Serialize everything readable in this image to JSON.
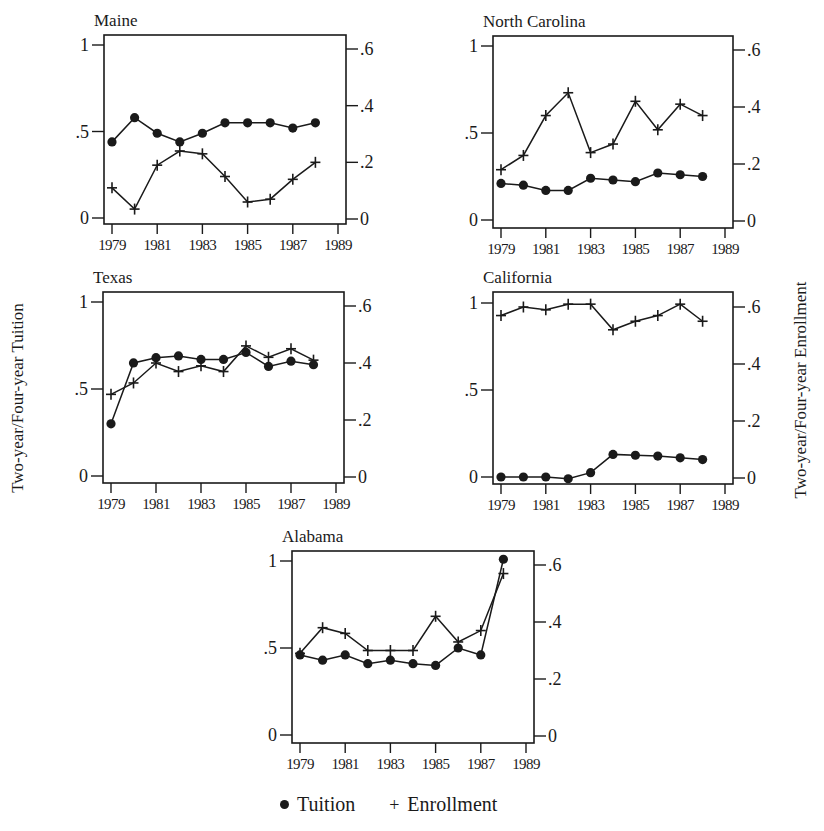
{
  "figure": {
    "y_label_left": "Two-year/Four-year Tuition",
    "y_label_right": "Two-year/Four-year Enrollment",
    "legend": [
      {
        "marker": "dot",
        "label": "Tuition"
      },
      {
        "marker": "plus",
        "label": "Enrollment"
      }
    ],
    "colors": {
      "ink": "#1a1a1a",
      "background": "#ffffff"
    }
  },
  "chart_data": [
    {
      "type": "line",
      "title": "Maine",
      "x": [
        1979,
        1980,
        1981,
        1982,
        1983,
        1984,
        1985,
        1986,
        1987,
        1988
      ],
      "xticks": [
        "1979",
        "1981",
        "1983",
        "1985",
        "1987",
        "1989"
      ],
      "left_axis": {
        "label": "Two-year/Four-year Tuition",
        "ticks": [
          "0",
          ".5",
          "1"
        ],
        "ylim": [
          0,
          1
        ]
      },
      "right_axis": {
        "label": "Two-year/Four-year Enrollment",
        "ticks": [
          "0",
          ".2",
          ".4",
          ".6"
        ],
        "ylim": [
          0,
          0.6
        ]
      },
      "series": [
        {
          "name": "Tuition",
          "axis": "left",
          "marker": "dot",
          "values": [
            0.44,
            0.58,
            0.49,
            0.44,
            0.49,
            0.55,
            0.55,
            0.55,
            0.52,
            0.55
          ]
        },
        {
          "name": "Enrollment",
          "axis": "right",
          "marker": "plus",
          "values": [
            0.11,
            0.035,
            0.19,
            0.24,
            0.23,
            0.15,
            0.06,
            0.07,
            0.14,
            0.2
          ]
        }
      ],
      "box": {
        "left": 104,
        "right": 346,
        "top": 35,
        "bottom": 224,
        "y1": 45,
        "y0": 218
      }
    },
    {
      "type": "line",
      "title": "North Carolina",
      "x": [
        1979,
        1980,
        1981,
        1982,
        1983,
        1984,
        1985,
        1986,
        1987,
        1988
      ],
      "xticks": [
        "1979",
        "1981",
        "1983",
        "1985",
        "1987",
        "1989"
      ],
      "left_axis": {
        "label": "Two-year/Four-year Tuition",
        "ticks": [
          "0",
          ".5",
          "1"
        ],
        "ylim": [
          0,
          1
        ]
      },
      "right_axis": {
        "label": "Two-year/Four-year Enrollment",
        "ticks": [
          "0",
          ".2",
          ".4",
          ".6"
        ],
        "ylim": [
          0,
          0.6
        ]
      },
      "series": [
        {
          "name": "Tuition",
          "axis": "left",
          "marker": "dot",
          "values": [
            0.21,
            0.2,
            0.17,
            0.17,
            0.24,
            0.23,
            0.22,
            0.27,
            0.26,
            0.25
          ]
        },
        {
          "name": "Enrollment",
          "axis": "right",
          "marker": "plus",
          "values": [
            0.18,
            0.23,
            0.37,
            0.45,
            0.24,
            0.27,
            0.42,
            0.32,
            0.41,
            0.37
          ]
        }
      ],
      "box": {
        "left": 493,
        "right": 733,
        "top": 36,
        "bottom": 228,
        "y1": 46,
        "y0": 220
      }
    },
    {
      "type": "line",
      "title": "Texas",
      "x": [
        1979,
        1980,
        1981,
        1982,
        1983,
        1984,
        1985,
        1986,
        1987,
        1988
      ],
      "xticks": [
        "1979",
        "1981",
        "1983",
        "1985",
        "1987",
        "1989"
      ],
      "left_axis": {
        "label": "Two-year/Four-year Tuition",
        "ticks": [
          "0",
          ".5",
          "1"
        ],
        "ylim": [
          0,
          1
        ]
      },
      "right_axis": {
        "label": "Two-year/Four-year Enrollment",
        "ticks": [
          "0",
          ".2",
          ".4",
          ".6"
        ],
        "ylim": [
          0,
          0.6
        ]
      },
      "series": [
        {
          "name": "Tuition",
          "axis": "left",
          "marker": "dot",
          "values": [
            0.3,
            0.65,
            0.68,
            0.69,
            0.67,
            0.67,
            0.71,
            0.63,
            0.66,
            0.64
          ]
        },
        {
          "name": "Enrollment",
          "axis": "right",
          "marker": "plus",
          "values": [
            0.29,
            0.33,
            0.4,
            0.37,
            0.39,
            0.37,
            0.46,
            0.42,
            0.45,
            0.41
          ]
        }
      ],
      "box": {
        "left": 103,
        "right": 344,
        "top": 292,
        "bottom": 483,
        "y1": 302,
        "y0": 476
      }
    },
    {
      "type": "line",
      "title": "California",
      "x": [
        1979,
        1980,
        1981,
        1982,
        1983,
        1984,
        1985,
        1986,
        1987,
        1988
      ],
      "xticks": [
        "1979",
        "1981",
        "1983",
        "1985",
        "1987",
        "1989"
      ],
      "left_axis": {
        "label": "Two-year/Four-year Tuition",
        "ticks": [
          "0",
          ".5",
          "1"
        ],
        "ylim": [
          0,
          1
        ]
      },
      "right_axis": {
        "label": "Two-year/Four-year Enrollment",
        "ticks": [
          "0",
          ".2",
          ".4",
          ".6"
        ],
        "ylim": [
          0,
          0.6
        ]
      },
      "series": [
        {
          "name": "Tuition",
          "axis": "left",
          "marker": "dot",
          "values": [
            0.0,
            0.0,
            0.0,
            -0.01,
            0.025,
            0.13,
            0.125,
            0.12,
            0.11,
            0.1
          ]
        },
        {
          "name": "Enrollment",
          "axis": "right",
          "marker": "plus",
          "values": [
            0.57,
            0.6,
            0.59,
            0.61,
            0.61,
            0.52,
            0.55,
            0.57,
            0.61,
            0.55
          ]
        }
      ],
      "box": {
        "left": 493,
        "right": 733,
        "top": 292,
        "bottom": 484,
        "y1": 303,
        "y0": 477
      }
    },
    {
      "type": "line",
      "title": "Alabama",
      "x": [
        1979,
        1980,
        1981,
        1982,
        1983,
        1984,
        1985,
        1986,
        1987,
        1988
      ],
      "xticks": [
        "1979",
        "1981",
        "1983",
        "1985",
        "1987",
        "1989"
      ],
      "left_axis": {
        "label": "Two-year/Four-year Tuition",
        "ticks": [
          "0",
          ".5",
          "1"
        ],
        "ylim": [
          0,
          1
        ]
      },
      "right_axis": {
        "label": "Two-year/Four-year Enrollment",
        "ticks": [
          "0",
          ".2",
          ".4",
          ".6"
        ],
        "ylim": [
          0,
          0.6
        ]
      },
      "series": [
        {
          "name": "Tuition",
          "axis": "left",
          "marker": "dot",
          "values": [
            0.46,
            0.43,
            0.46,
            0.41,
            0.43,
            0.41,
            0.4,
            0.5,
            0.46,
            1.01
          ]
        },
        {
          "name": "Enrollment",
          "axis": "right",
          "marker": "plus",
          "values": [
            0.29,
            0.38,
            0.36,
            0.3,
            0.3,
            0.3,
            0.42,
            0.33,
            0.37,
            0.57
          ]
        }
      ],
      "box": {
        "left": 292,
        "right": 534,
        "top": 551,
        "bottom": 743,
        "y1": 561,
        "y0": 735
      }
    }
  ]
}
